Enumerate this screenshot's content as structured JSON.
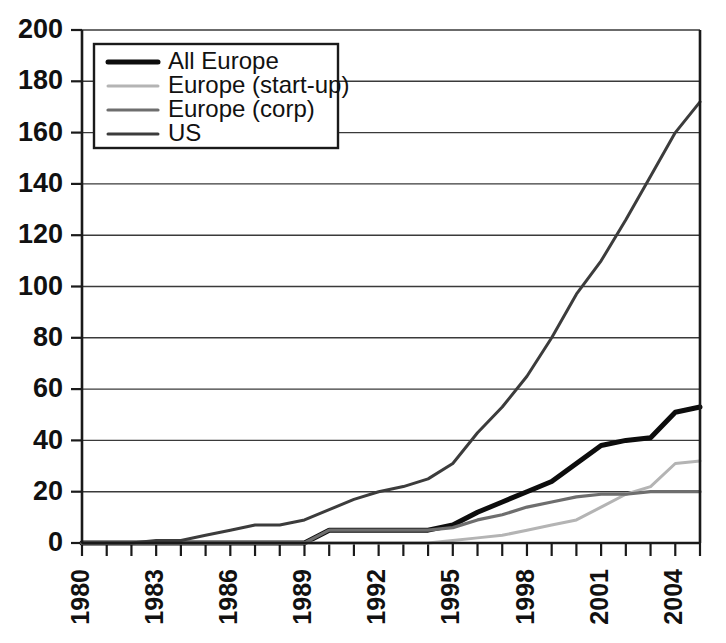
{
  "chart_data": {
    "type": "line",
    "title": "",
    "subtitle": "",
    "xlabel": "",
    "ylabel": "",
    "xlim": [
      1980,
      2005
    ],
    "ylim": [
      0,
      200
    ],
    "grid": true,
    "grid_axis": "y",
    "legend_position": "top-left",
    "x": [
      1980,
      1981,
      1982,
      1983,
      1984,
      1985,
      1986,
      1987,
      1988,
      1989,
      1990,
      1991,
      1992,
      1993,
      1994,
      1995,
      1996,
      1997,
      1998,
      1999,
      2000,
      2001,
      2002,
      2003,
      2004,
      2005
    ],
    "xtick_values": [
      1980,
      1983,
      1986,
      1989,
      1992,
      1995,
      1998,
      2001,
      2004
    ],
    "xtick_labels": [
      "1980",
      "1983",
      "1986",
      "1989",
      "1992",
      "1995",
      "1998",
      "2001",
      "2004"
    ],
    "ytick_values": [
      0,
      20,
      40,
      60,
      80,
      100,
      120,
      140,
      160,
      180,
      200
    ],
    "ytick_labels": [
      "0",
      "20",
      "40",
      "60",
      "80",
      "100",
      "120",
      "140",
      "160",
      "180",
      "200"
    ],
    "series": [
      {
        "name": "All Europe",
        "color": "#0d0d0d",
        "width": 5.0,
        "dash": "none",
        "values": [
          0,
          0,
          0,
          0,
          0,
          0,
          0,
          0,
          0,
          0,
          5,
          5,
          5,
          5,
          5,
          7,
          12,
          16,
          20,
          24,
          31,
          38,
          40,
          41,
          51,
          53
        ]
      },
      {
        "name": "Europe (start-up)",
        "color": "#b4b4b4",
        "width": 3.0,
        "dash": "none",
        "values": [
          0,
          0,
          0,
          0,
          0,
          0,
          0,
          0,
          0,
          0,
          0,
          0,
          0,
          0,
          0,
          1,
          2,
          3,
          5,
          7,
          9,
          14,
          19,
          22,
          31,
          32
        ]
      },
      {
        "name": "Europe (corp)",
        "color": "#6e6e6e",
        "width": 3.2,
        "dash": "none",
        "values": [
          0,
          0,
          0,
          0,
          0,
          0,
          0,
          0,
          0,
          0,
          5,
          5,
          5,
          5,
          5,
          6,
          9,
          11,
          14,
          16,
          18,
          19,
          19,
          20,
          20,
          20
        ]
      },
      {
        "name": "US",
        "color": "#3c3c3c",
        "width": 3.0,
        "dash": "none",
        "values": [
          0,
          0,
          0,
          1,
          1,
          3,
          5,
          7,
          7,
          9,
          13,
          17,
          20,
          22,
          25,
          31,
          43,
          53,
          65,
          80,
          97,
          110,
          126,
          143,
          160,
          172
        ]
      }
    ]
  },
  "legend": {
    "entries": [
      {
        "label": "All Europe"
      },
      {
        "label": "Europe (start-up)"
      },
      {
        "label": "Europe (corp)"
      },
      {
        "label": "US"
      }
    ]
  }
}
